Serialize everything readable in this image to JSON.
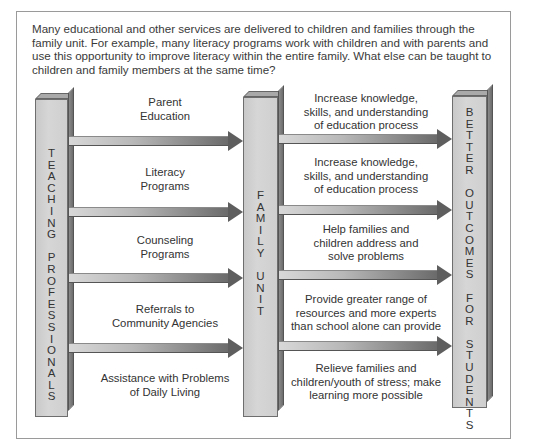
{
  "intro": "Many educational and other services are delivered to children and families through the family unit. For example, many literacy programs work with children and with parents and use this opportunity to improve literacy within the entire family. What else can be taught to children and family members at the same time?",
  "pillars": {
    "left": {
      "label": "TEACHING PROFESSIONALS",
      "letters": [
        "T",
        "E",
        "A",
        "C",
        "H",
        "I",
        "N",
        "G",
        "",
        "P",
        "R",
        "O",
        "F",
        "E",
        "S",
        "S",
        "I",
        "O",
        "N",
        "A",
        "L",
        "S"
      ]
    },
    "middle": {
      "label": "FAMILY UNIT",
      "letters": [
        "F",
        "A",
        "M",
        "I",
        "L",
        "Y",
        "",
        "U",
        "N",
        "I",
        "T"
      ]
    },
    "right": {
      "label": "BETTER OUTCOMES FOR STUDENTS",
      "letters": [
        "B",
        "E",
        "T",
        "T",
        "E",
        "R",
        "",
        "O",
        "U",
        "T",
        "C",
        "O",
        "M",
        "E",
        "S",
        "",
        "F",
        "O",
        "R",
        "",
        "S",
        "T",
        "U",
        "D",
        "E",
        "N",
        "T",
        "S"
      ]
    }
  },
  "services": [
    {
      "lines": [
        "Parent",
        "Education"
      ]
    },
    {
      "lines": [
        "Literacy",
        "Programs"
      ]
    },
    {
      "lines": [
        "Counseling",
        "Programs"
      ]
    },
    {
      "lines": [
        "Referrals to",
        "Community Agencies"
      ]
    },
    {
      "lines": [
        "Assistance with Problems",
        "of Daily Living"
      ]
    }
  ],
  "outcomes": [
    {
      "lines": [
        "Increase knowledge,",
        "skills, and understanding",
        "of education process"
      ]
    },
    {
      "lines": [
        "Increase knowledge,",
        "skills, and understanding",
        "of education process"
      ]
    },
    {
      "lines": [
        "Help families and",
        "children address and",
        "solve problems"
      ]
    },
    {
      "lines": [
        "Provide greater range of",
        "resources and more experts",
        "than school alone can provide"
      ]
    },
    {
      "lines": [
        "Relieve families and",
        "children/youth of stress; make",
        "learning more possible"
      ]
    }
  ],
  "colors": {
    "pillar": "#d0d0d0",
    "arrow_dark": "#5e5e5e",
    "frame": "#9a9a9a"
  }
}
